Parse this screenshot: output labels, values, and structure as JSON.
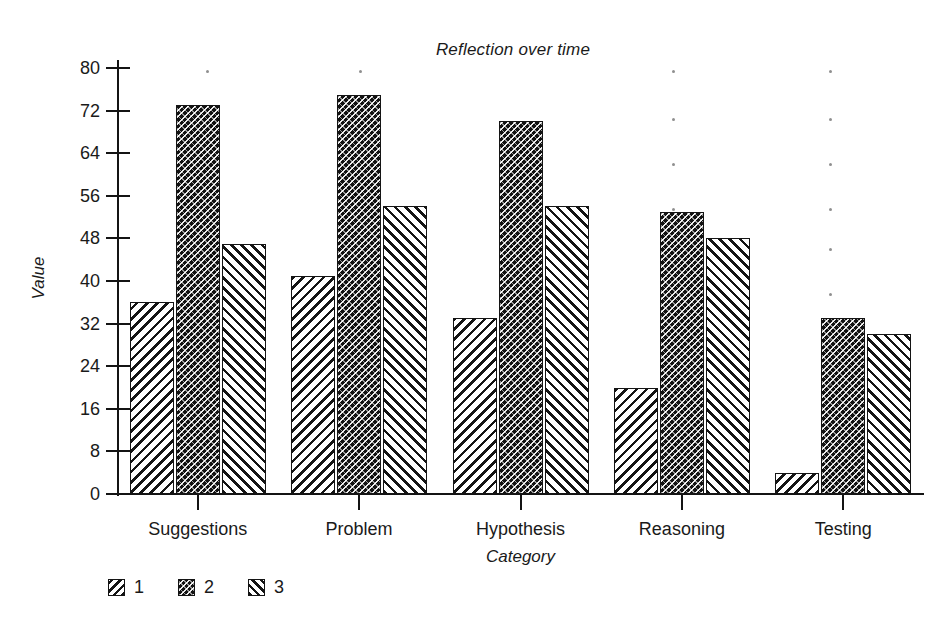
{
  "chart_data": {
    "type": "bar",
    "title": "Reflection over time",
    "xlabel": "Category",
    "ylabel": "Value",
    "categories": [
      "Suggestions",
      "Problem",
      "Hypothesis",
      "Reasoning",
      "Testing"
    ],
    "series": [
      {
        "name": "1",
        "values": [
          36,
          41,
          33,
          20,
          4
        ]
      },
      {
        "name": "2",
        "values": [
          73,
          75,
          70,
          53,
          33
        ]
      },
      {
        "name": "3",
        "values": [
          47,
          54,
          54,
          48,
          30
        ]
      }
    ],
    "ylim": [
      0,
      80
    ],
    "ytick_labels": [
      "0",
      "8",
      "16",
      "24",
      "32",
      "40",
      "48",
      "56",
      "64",
      "72",
      "80"
    ],
    "ytick_values": [
      0,
      8,
      16,
      24,
      32,
      40,
      48,
      56,
      64,
      72,
      80
    ],
    "grid": false,
    "legend_position": "bottom-left",
    "legend_entries": [
      "1",
      "2",
      "3"
    ],
    "colors": {
      "ink": "#141414",
      "background": "#ffffff",
      "series_1_fill": "#ffffff",
      "series_2_fill": "#121212",
      "series_3_fill": "#ffffff"
    }
  },
  "speckles": [
    {
      "x": 206,
      "y": 70
    },
    {
      "x": 359,
      "y": 70
    },
    {
      "x": 672,
      "y": 70
    },
    {
      "x": 829,
      "y": 70
    },
    {
      "x": 672,
      "y": 118
    },
    {
      "x": 829,
      "y": 118
    },
    {
      "x": 672,
      "y": 163
    },
    {
      "x": 829,
      "y": 163
    },
    {
      "x": 672,
      "y": 208
    },
    {
      "x": 829,
      "y": 208
    },
    {
      "x": 829,
      "y": 248
    },
    {
      "x": 829,
      "y": 293
    },
    {
      "x": 829,
      "y": 338
    },
    {
      "x": 829,
      "y": 383
    }
  ]
}
